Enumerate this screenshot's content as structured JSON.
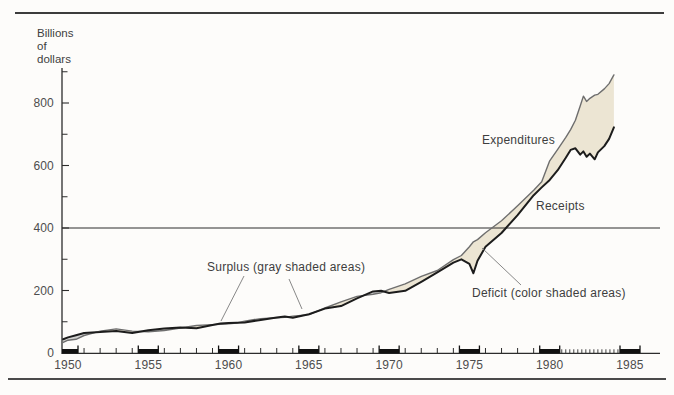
{
  "figure": {
    "y_axis_label": [
      "Billions",
      "of",
      "dollars"
    ],
    "annotations": {
      "expenditures": "Expenditures",
      "receipts": "Receipts",
      "surplus": "Surplus (gray shaded areas)",
      "deficit": "Deficit (color shaded areas)"
    }
  },
  "chart_data": {
    "type": "line",
    "ylabel": "Billions of dollars",
    "xlim": [
      1949.6,
      1986.8
    ],
    "ylim": [
      0,
      920
    ],
    "grid": "off",
    "legend": "inline labels on curves",
    "reference_line_y": 400,
    "x_ticks_labeled": [
      1950,
      1955,
      1960,
      1965,
      1970,
      1975,
      1980,
      1985
    ],
    "x_bold_marker_years": [
      1950,
      1955,
      1960,
      1965,
      1970,
      1975,
      1980,
      1985
    ],
    "x_minor_ticks_quarterly_range": [
      1980.75,
      1984.25
    ],
    "y_ticks_labeled": [
      0,
      200,
      400,
      600,
      800
    ],
    "y_ticks_minor": [
      100,
      300,
      500,
      700,
      900
    ],
    "x": [
      1949.7,
      1950,
      1950.5,
      1951,
      1951.5,
      1952,
      1953,
      1954,
      1955,
      1956,
      1957,
      1958,
      1959,
      1959.5,
      1960,
      1960.5,
      1961,
      1962,
      1963,
      1963.5,
      1964,
      1965,
      1966,
      1967,
      1968,
      1969,
      1969.5,
      1970,
      1971,
      1972,
      1973,
      1974,
      1974.5,
      1975,
      1975.25,
      1975.5,
      1976,
      1977,
      1978,
      1979,
      1979.5,
      1980,
      1980.5,
      1981,
      1981.3,
      1981.6,
      1981.9,
      1982.1,
      1982.3,
      1982.5,
      1982.8,
      1983,
      1983.4,
      1983.7,
      1984
    ],
    "series": [
      {
        "name": "Receipts",
        "color": "#1c1c1c",
        "values": [
          44,
          50,
          57,
          64,
          66,
          67,
          70,
          64,
          73,
          78,
          82,
          79,
          90,
          94,
          96,
          97,
          98,
          106,
          114,
          117,
          113,
          124,
          142,
          150,
          175,
          197,
          199,
          192,
          199,
          228,
          258,
          289,
          300,
          285,
          255,
          295,
          340,
          384,
          441,
          505,
          530,
          554,
          585,
          625,
          650,
          655,
          635,
          645,
          628,
          638,
          620,
          642,
          662,
          685,
          722
        ]
      },
      {
        "name": "Expenditures",
        "color": "#6e6e6e",
        "values": [
          34,
          41,
          44,
          56,
          63,
          70,
          77,
          70,
          68,
          72,
          80,
          88,
          91,
          92,
          93,
          96,
          102,
          110,
          113,
          114,
          118,
          123,
          144,
          164,
          181,
          188,
          193,
          204,
          221,
          245,
          264,
          299,
          312,
          340,
          356,
          363,
          385,
          423,
          471,
          521,
          548,
          615,
          652,
          690,
          715,
          745,
          790,
          822,
          805,
          815,
          825,
          828,
          845,
          862,
          890
        ]
      }
    ],
    "shading": {
      "surplus": {
        "label": "Surplus (gray shaded areas)",
        "condition": "receipts > expenditures",
        "color": "#d2d2d0"
      },
      "deficit": {
        "label": "Deficit (color shaded areas)",
        "condition": "expenditures > receipts",
        "color": "#ece5d3"
      }
    }
  }
}
